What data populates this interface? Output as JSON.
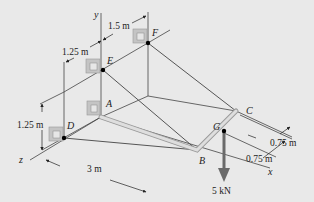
{
  "figure": {
    "type": "3d-statics-diagram",
    "background": "#e9e9e9",
    "axes": {
      "x": "x",
      "y": "y",
      "z": "z"
    },
    "points": {
      "A": "A",
      "B": "B",
      "C": "C",
      "D": "D",
      "E": "E",
      "F": "F",
      "G": "G"
    },
    "dimensions": {
      "ef_spacing": "1.5 m",
      "e_offset": "1.25 m",
      "d_height": "1.25 m",
      "length_db": "3 m",
      "cg_half": "0.75 m",
      "gb_half": "0.75 m"
    },
    "load": {
      "label": "5 kN",
      "color": "#6a6a6a"
    },
    "colors": {
      "cable": "#555555",
      "member": "#c8c8c8",
      "bracket": "#bdbdbd"
    }
  }
}
